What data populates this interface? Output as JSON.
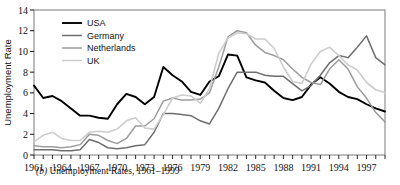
{
  "figure": {
    "caption_letter": "(b)",
    "caption_text": "Unemployment Rates, 1961–1999"
  },
  "chart_data": {
    "type": "line",
    "title": "",
    "xlabel": "",
    "ylabel": "Unemployment Rate",
    "xlim": [
      1961,
      1999
    ],
    "ylim": [
      0,
      14
    ],
    "yticks": [
      0,
      2,
      4,
      6,
      8,
      10,
      12,
      14
    ],
    "xticks_labeled": [
      1961,
      1964,
      1967,
      1970,
      1973,
      1976,
      1979,
      1982,
      1985,
      1988,
      1991,
      1994,
      1997
    ],
    "xtick_interval_minor": 1,
    "grid": false,
    "legend_position": "top-left",
    "x": [
      1961,
      1962,
      1963,
      1964,
      1965,
      1966,
      1967,
      1968,
      1969,
      1970,
      1971,
      1972,
      1973,
      1974,
      1975,
      1976,
      1977,
      1978,
      1979,
      1980,
      1981,
      1982,
      1983,
      1984,
      1985,
      1986,
      1987,
      1988,
      1989,
      1990,
      1991,
      1992,
      1993,
      1994,
      1995,
      1996,
      1997,
      1998,
      1999
    ],
    "series": [
      {
        "name": "USA",
        "color": "#000000",
        "width": 1.9,
        "values": [
          6.7,
          5.5,
          5.7,
          5.2,
          4.5,
          3.8,
          3.8,
          3.6,
          3.5,
          4.9,
          5.9,
          5.6,
          4.9,
          5.6,
          8.5,
          7.7,
          7.1,
          6.1,
          5.8,
          7.1,
          7.6,
          9.7,
          9.6,
          7.5,
          7.2,
          7.0,
          6.2,
          5.5,
          5.3,
          5.6,
          6.8,
          7.5,
          6.9,
          6.1,
          5.6,
          5.4,
          4.9,
          4.5,
          4.2
        ]
      },
      {
        "name": "Germany",
        "color": "#6e6e6e",
        "width": 1.5,
        "values": [
          0.5,
          0.5,
          0.5,
          0.4,
          0.4,
          0.5,
          1.5,
          1.2,
          0.7,
          0.6,
          0.7,
          0.9,
          1.0,
          2.2,
          4.0,
          4.0,
          3.9,
          3.8,
          3.3,
          3.0,
          4.5,
          6.4,
          8.0,
          8.0,
          8.0,
          7.7,
          7.6,
          7.6,
          6.9,
          6.2,
          6.7,
          7.7,
          8.9,
          9.6,
          9.4,
          10.4,
          11.5,
          9.4,
          8.7
        ]
      },
      {
        "name": "Netherlands",
        "color": "#9c9c9c",
        "width": 1.5,
        "values": [
          0.9,
          0.8,
          0.8,
          0.7,
          0.8,
          1.0,
          2.0,
          1.9,
          1.4,
          1.1,
          1.6,
          2.8,
          2.8,
          3.5,
          5.2,
          5.5,
          5.3,
          5.3,
          5.4,
          6.0,
          8.5,
          11.4,
          12.0,
          11.8,
          10.6,
          9.9,
          9.6,
          9.2,
          8.3,
          7.5,
          7.0,
          6.8,
          8.3,
          9.2,
          8.3,
          6.6,
          5.5,
          4.1,
          3.2
        ]
      },
      {
        "name": "UK",
        "color": "#cdcdcd",
        "width": 1.6,
        "values": [
          1.3,
          1.9,
          2.2,
          1.6,
          1.4,
          1.4,
          2.2,
          2.3,
          2.2,
          2.5,
          3.3,
          3.6,
          2.6,
          2.5,
          3.9,
          5.5,
          5.8,
          5.7,
          5.0,
          6.4,
          9.8,
          11.3,
          11.8,
          11.7,
          11.2,
          11.2,
          10.3,
          8.5,
          7.1,
          6.9,
          8.8,
          10.0,
          10.4,
          9.6,
          8.7,
          8.2,
          7.0,
          6.3,
          6.0
        ]
      }
    ]
  },
  "axes": {
    "ytick_labels": [
      "0",
      "2",
      "4",
      "6",
      "8",
      "10",
      "12",
      "14"
    ],
    "xtick_labels": [
      "1961",
      "1964",
      "1967",
      "1970",
      "1973",
      "1976",
      "1979",
      "1982",
      "1985",
      "1988",
      "1991",
      "1994",
      "1997"
    ]
  },
  "legend": {
    "items": [
      {
        "label": "USA",
        "color": "#000000"
      },
      {
        "label": "Germany",
        "color": "#6e6e6e"
      },
      {
        "label": "Netherlands",
        "color": "#9c9c9c"
      },
      {
        "label": "UK",
        "color": "#cdcdcd"
      }
    ]
  }
}
